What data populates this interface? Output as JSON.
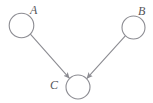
{
  "figure": {
    "kind": "directed-graph",
    "background_color": "#ffffff",
    "width": 153,
    "height": 103
  },
  "style": {
    "node_stroke_color": "#8c8c92",
    "node_fill_color": "#ffffff",
    "node_stroke_width": 1.1,
    "edge_color": "#8c8c92",
    "edge_width": 1.1,
    "arrowhead_color": "#8c8c92",
    "label_color": "#55555a",
    "label_font_size": 12,
    "label_style": "italic-serif"
  },
  "nodes": [
    {
      "id": "A",
      "label": "A",
      "cx": 21.5,
      "cy": 25.5,
      "r": 12.3,
      "label_x": 30,
      "label_y": 14,
      "label_position": "upper-right"
    },
    {
      "id": "B",
      "label": "B",
      "cx": 133.5,
      "cy": 27.5,
      "r": 11.5,
      "label_x": 138,
      "label_y": 15,
      "label_position": "upper-right"
    },
    {
      "id": "C",
      "label": "C",
      "cx": 78,
      "cy": 87,
      "r": 12,
      "label_x": 50,
      "label_y": 89,
      "label_position": "left"
    }
  ],
  "edges": [
    {
      "id": "A-to-C",
      "from": "A",
      "to": "C",
      "directed": true,
      "x1": 30.6,
      "y1": 34.3,
      "x2": 69.3,
      "y2": 78.2,
      "arrowhead_at": "C"
    },
    {
      "id": "B-to-C",
      "from": "B",
      "to": "C",
      "directed": true,
      "x1": 125.3,
      "y1": 35.8,
      "x2": 86.9,
      "y2": 78.3,
      "arrowhead_at": "C"
    }
  ]
}
